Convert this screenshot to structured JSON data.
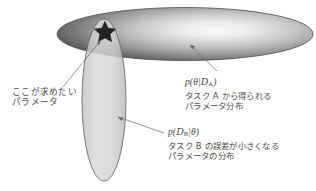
{
  "diagram": {
    "kind": "bayesian-parameter-distribution-intersection",
    "shapes": {
      "horizontal_ellipse": {
        "name": "task-a-posterior-ellipse",
        "cx": 185,
        "cy": 34,
        "rx": 128,
        "ry": 27,
        "fill_center": "#f2f2f2",
        "fill_edge": "#5d5d5d",
        "stroke": "#4a4a4a"
      },
      "vertical_ellipse": {
        "name": "task-b-likelihood-ellipse",
        "cx": 104,
        "cy": 100,
        "rx": 22,
        "ry": 82,
        "fill": "#d2d2d2",
        "stroke": "#6b6b6b"
      },
      "star": {
        "name": "optimal-parameter-star",
        "cx": 105,
        "cy": 31,
        "r": 11,
        "fill": "#2c2c2c"
      }
    },
    "leaders": [
      {
        "name": "leader-target",
        "from": [
          64,
          86
        ],
        "to": [
          104,
          38
        ]
      },
      {
        "name": "leader-task-a",
        "from": [
          215,
          72
        ],
        "to": [
          188,
          46
        ]
      },
      {
        "name": "leader-task-b",
        "from": [
          163,
          133
        ],
        "to": [
          116,
          116
        ]
      }
    ]
  },
  "labels": {
    "target": {
      "line1": "ここが求めたい",
      "line2": "パラメータ"
    },
    "task_a": {
      "formula_p": "p",
      "formula_open": "(",
      "formula_theta": "θ",
      "formula_bar": "|",
      "formula_d": "D",
      "formula_sub": "A",
      "formula_close": ")",
      "formula_plain": "p(θ|D_A)",
      "line1": "タスク A から得られる",
      "line2": "パラメータ分布"
    },
    "task_b": {
      "formula_p": "p",
      "formula_open": "(",
      "formula_d": "D",
      "formula_sub": "B",
      "formula_bar": "|",
      "formula_theta": "θ",
      "formula_close": ")",
      "formula_plain": "p(D_B|θ)",
      "line1": "タスク B の誤差が小さくなる",
      "line2": "パラメータの分布"
    }
  },
  "colors": {
    "background": "#ffffff",
    "text": "#4a4a4a",
    "outline": "#5a5a5a"
  }
}
